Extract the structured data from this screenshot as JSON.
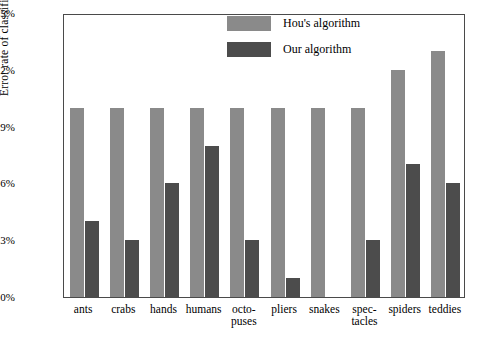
{
  "chart_data": {
    "type": "bar",
    "title": "",
    "xlabel": "",
    "ylabel": "Error rate of classification",
    "ylim": [
      0,
      15
    ],
    "ytick_values": [
      0,
      3,
      6,
      9,
      12,
      15
    ],
    "ytick_labels": [
      "0%",
      "3%",
      "6%",
      "9%",
      "12%",
      "15%"
    ],
    "grid": false,
    "legend_position": "top-center",
    "categories": [
      "ants",
      "crabs",
      "hands",
      "humans",
      "octo-puses",
      "pliers",
      "snakes",
      "spec-tacles",
      "spiders",
      "teddies"
    ],
    "category_lines": [
      [
        "ants"
      ],
      [
        "crabs"
      ],
      [
        "hands"
      ],
      [
        "humans"
      ],
      [
        "octo-",
        "puses"
      ],
      [
        "pliers"
      ],
      [
        "snakes"
      ],
      [
        "spec-",
        "tacles"
      ],
      [
        "spiders"
      ],
      [
        "teddies"
      ]
    ],
    "series": [
      {
        "name": "Hou's algorithm",
        "color": "#8a8a8a",
        "values": [
          10,
          10,
          10,
          10,
          10,
          10,
          10,
          10,
          12,
          13
        ]
      },
      {
        "name": "Our algorithm",
        "color": "#4c4c4c",
        "values": [
          4,
          3,
          6,
          8,
          3,
          1,
          0,
          3,
          7,
          6
        ]
      }
    ]
  },
  "legend": {
    "items": [
      {
        "label": "Hou's algorithm"
      },
      {
        "label": "Our algorithm"
      }
    ]
  }
}
